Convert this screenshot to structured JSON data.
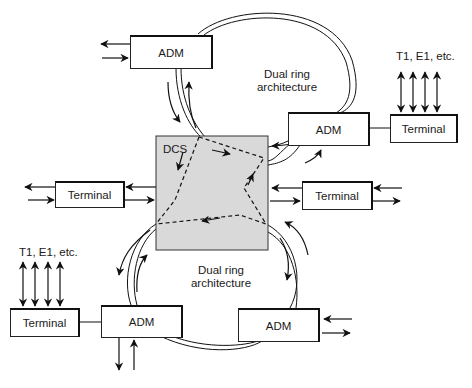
{
  "diagram": {
    "type": "network-architecture",
    "center_node": {
      "label": "DCS"
    },
    "rings": [
      {
        "label_line1": "Dual ring",
        "label_line2": "architecture",
        "position": "top"
      },
      {
        "label_line1": "Dual ring",
        "label_line2": "architecture",
        "position": "bottom"
      }
    ],
    "nodes": {
      "adm_top_left": "ADM",
      "adm_top_right": "ADM",
      "adm_bottom_left": "ADM",
      "adm_bottom_right": "ADM",
      "terminal_top_right": "Terminal",
      "terminal_left": "Terminal",
      "terminal_right": "Terminal",
      "terminal_bottom_left": "Terminal"
    },
    "tributary_labels": {
      "top_right": "T1, E1, etc.",
      "bottom_left": "T1, E1, etc."
    },
    "edges": [
      {
        "from": "adm_top_left",
        "to": "DCS",
        "kind": "dual-ring"
      },
      {
        "from": "adm_top_left",
        "to": "adm_top_right",
        "kind": "dual-ring"
      },
      {
        "from": "adm_top_right",
        "to": "DCS",
        "kind": "dual-ring"
      },
      {
        "from": "adm_top_right",
        "to": "terminal_top_right",
        "kind": "line"
      },
      {
        "from": "terminal_left",
        "to": "DCS",
        "kind": "bidirectional"
      },
      {
        "from": "terminal_right",
        "to": "DCS",
        "kind": "bidirectional"
      },
      {
        "from": "DCS",
        "to": "adm_bottom_left",
        "kind": "dual-ring"
      },
      {
        "from": "DCS",
        "to": "adm_bottom_right",
        "kind": "dual-ring"
      },
      {
        "from": "adm_bottom_left",
        "to": "adm_bottom_right",
        "kind": "dual-ring"
      },
      {
        "from": "terminal_bottom_left",
        "to": "adm_bottom_left",
        "kind": "line"
      }
    ],
    "colors": {
      "dcs_fill": "#d9d9d9",
      "stroke": "#111111"
    }
  }
}
